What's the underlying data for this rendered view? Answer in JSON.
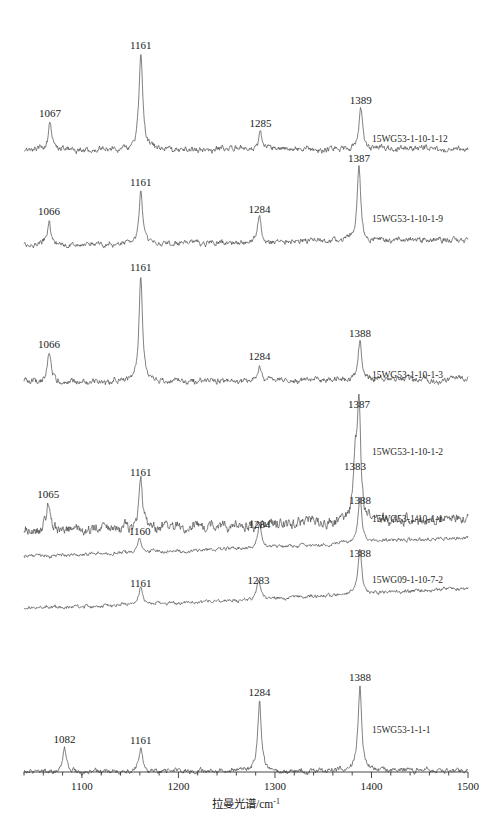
{
  "figure": {
    "kind": "stacked-raman-spectra",
    "axis": {
      "xlabel": "拉曼光谱/cm",
      "xlabel_sup": "-1",
      "xmin": 1040,
      "xmax": 1500,
      "major_ticks": [
        1100,
        1200,
        1300,
        1400,
        1500
      ],
      "major_tick_labels": [
        "1100",
        "1200",
        "1300",
        "1400",
        "1500"
      ],
      "minor_tick_step": 20,
      "ylabel": ""
    },
    "line_color": "#4a4a4a",
    "axis_color": "#333333"
  },
  "chart_data": {
    "type": "line",
    "title": "",
    "xlabel": "拉曼光谱/cm-1",
    "ylabel": "Intensity (a.u.)",
    "xlim": [
      1040,
      1500
    ],
    "grid": false,
    "legend": "right-inline",
    "series": [
      {
        "name": "15WG53-1-10-1-12",
        "label_x": 1388,
        "peaks": [
          {
            "wavenumber": 1067,
            "label": "1067",
            "height": 0.28
          },
          {
            "wavenumber": 1161,
            "label": "1161",
            "height": 1.0
          },
          {
            "wavenumber": 1285,
            "label": "1285",
            "height": 0.18
          },
          {
            "wavenumber": 1389,
            "label": "1389",
            "height": 0.42
          }
        ],
        "baseline_slope": 0.02,
        "noise": 0.022
      },
      {
        "name": "15WG53-1-10-1-9",
        "label_x": 1388,
        "peaks": [
          {
            "wavenumber": 1066,
            "label": "1066",
            "height": 0.3
          },
          {
            "wavenumber": 1161,
            "label": "1161",
            "height": 0.66
          },
          {
            "wavenumber": 1284,
            "label": "1284",
            "height": 0.33
          },
          {
            "wavenumber": 1387,
            "label": "1387",
            "height": 0.96
          }
        ],
        "baseline_slope": 0.07,
        "noise": 0.025
      },
      {
        "name": "15WG53-1-10-1-3",
        "label_x": 1388,
        "peaks": [
          {
            "wavenumber": 1066,
            "label": "1066",
            "height": 0.27
          },
          {
            "wavenumber": 1161,
            "label": "1161",
            "height": 1.0
          },
          {
            "wavenumber": 1284,
            "label": "1284",
            "height": 0.15
          },
          {
            "wavenumber": 1388,
            "label": "1388",
            "height": 0.37
          }
        ],
        "baseline_slope": 0.03,
        "noise": 0.02
      },
      {
        "name": "15WG53-1-10-1-2",
        "label_x": 1388,
        "peaks": [
          {
            "wavenumber": 1065,
            "label": "1065",
            "height": 0.22
          },
          {
            "wavenumber": 1161,
            "label": "1161",
            "height": 0.4
          },
          {
            "wavenumber": 1383,
            "label": "1383",
            "height": 0.45
          },
          {
            "wavenumber": 1387,
            "label": "1387",
            "height": 0.97
          }
        ],
        "baseline_slope": 0.1,
        "noise": 0.03
      },
      {
        "name": "15WG53-1-10-1-1",
        "label_x": 1388,
        "peaks": [
          {
            "wavenumber": 1160,
            "label": "1160",
            "height": 0.3
          },
          {
            "wavenumber": 1284,
            "label": "1284",
            "height": 0.44
          },
          {
            "wavenumber": 1388,
            "label": "1388",
            "height": 0.93
          }
        ],
        "baseline_slope": 0.38,
        "noise": 0.026
      },
      {
        "name": "15WG09-1-10-7-2",
        "label_x": 1388,
        "peaks": [
          {
            "wavenumber": 1161,
            "label": "1161",
            "height": 0.31
          },
          {
            "wavenumber": 1283,
            "label": "1283",
            "height": 0.36
          },
          {
            "wavenumber": 1388,
            "label": "1388",
            "height": 0.9
          }
        ],
        "baseline_slope": 0.4,
        "noise": 0.026
      },
      {
        "name": "15WG53-1-1-1",
        "label_x": 1388,
        "peaks": [
          {
            "wavenumber": 1082,
            "label": "1082",
            "height": 0.26
          },
          {
            "wavenumber": 1161,
            "label": "1161",
            "height": 0.25
          },
          {
            "wavenumber": 1284,
            "label": "1284",
            "height": 0.78
          },
          {
            "wavenumber": 1388,
            "label": "1388",
            "height": 0.95
          }
        ],
        "baseline_slope": 0.02,
        "noise": 0.02
      }
    ]
  }
}
